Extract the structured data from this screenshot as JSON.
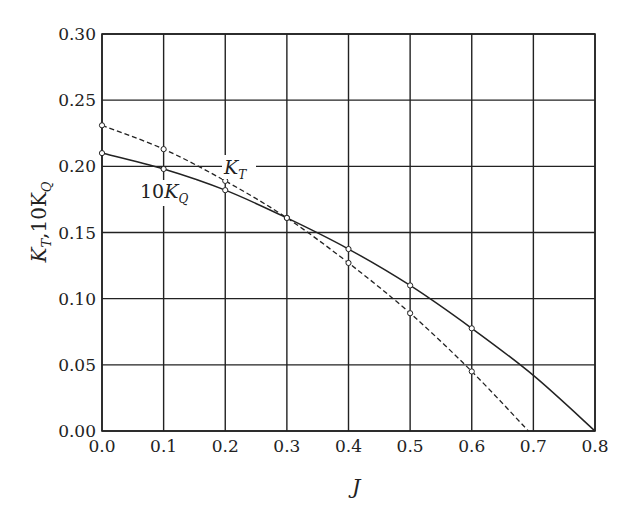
{
  "chart_data": {
    "type": "line",
    "title": "",
    "xlabel": "J",
    "ylabel": "K_T, 10K_Q",
    "xlim": [
      0.0,
      0.8
    ],
    "ylim": [
      0.0,
      0.3
    ],
    "grid": true,
    "legend": "inline labels",
    "x_ticks": [
      "0.0",
      "0.1",
      "0.2",
      "0.3",
      "0.4",
      "0.5",
      "0.6",
      "0.7",
      "0.8"
    ],
    "y_ticks": [
      "0.00",
      "0.05",
      "0.10",
      "0.15",
      "0.20",
      "0.25",
      "0.30"
    ],
    "series": [
      {
        "name": "K_T",
        "label": "K_T",
        "style": "dashed",
        "markers": true,
        "x": [
          0.0,
          0.1,
          0.2,
          0.3,
          0.4,
          0.5,
          0.6,
          0.692
        ],
        "values": [
          0.231,
          0.213,
          0.189,
          0.161,
          0.127,
          0.089,
          0.045,
          0.0
        ],
        "marker_points": 7
      },
      {
        "name": "10K_Q",
        "label": "10K_Q",
        "style": "solid",
        "markers": true,
        "x": [
          0.0,
          0.1,
          0.2,
          0.3,
          0.4,
          0.5,
          0.6,
          0.7,
          0.8
        ],
        "values": [
          0.21,
          0.198,
          0.182,
          0.161,
          0.1375,
          0.11,
          0.0776,
          0.042,
          0.0
        ],
        "marker_points": 7
      }
    ],
    "annotations": [
      {
        "text": "K_T",
        "near": [
          0.2,
          0.19
        ]
      },
      {
        "text": "10K_Q",
        "near": [
          0.1,
          0.18
        ]
      }
    ]
  },
  "labels": {
    "xlabel": "J",
    "ylabel_main": "K",
    "ylabel_sub1": "T",
    "ylabel_mid": ",10K",
    "ylabel_sub2": "Q",
    "kt_main": "K",
    "kt_sub": "T",
    "kq_prefix": "10",
    "kq_main": "K",
    "kq_sub": "Q"
  },
  "colors": {
    "line": "#222222",
    "grid": "#222222",
    "background": "#ffffff"
  }
}
